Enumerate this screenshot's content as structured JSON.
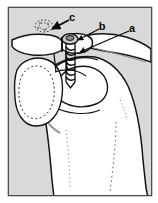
{
  "figure": {
    "kind": "anatomical-illustration",
    "title": "",
    "caption": "",
    "frame": {
      "outer_background": "#ffffff",
      "border_color": "#4a4a4a",
      "panel_background": "#d7d7d7",
      "bone_fill": "#ffffff",
      "ink_color": "#101010",
      "shading_color": "#b8b8b8"
    },
    "labels": [
      {
        "id": "label-a",
        "text": "a",
        "x": 131,
        "y": 28,
        "leader": "line down-left to arrowhead on screw shaft"
      },
      {
        "id": "label-b",
        "text": "b",
        "x": 101,
        "y": 26,
        "leader": "line down-left to arrowhead on screw head"
      },
      {
        "id": "label-c",
        "text": "c",
        "x": 72,
        "y": 18,
        "leader": "arrow down-left to stippled circular region"
      }
    ],
    "structures": [
      "clavicle",
      "acromion",
      "coracoid process",
      "glenoid",
      "humeral head",
      "humeral shaft",
      "cannulated screw"
    ]
  }
}
